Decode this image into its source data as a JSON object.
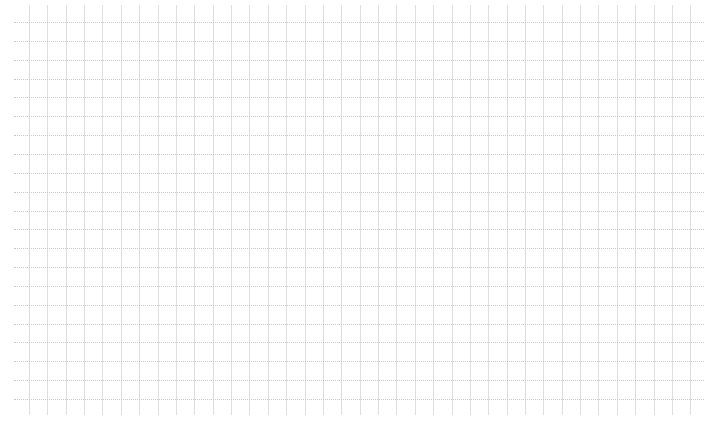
{
  "canvas": {
    "width": 719,
    "height": 425,
    "background": "#ffffff"
  },
  "grid": {
    "vertical": {
      "count": 37,
      "start_x": 29,
      "spacing": 18.37,
      "top": 5,
      "bottom": 415,
      "color": "#dedede",
      "style": "solid"
    },
    "horizontal": {
      "count": 21,
      "start_y": 22,
      "spacing": 18.85,
      "left": 14,
      "right": 704,
      "color": "#c8c8c8",
      "style": "dotted"
    }
  }
}
